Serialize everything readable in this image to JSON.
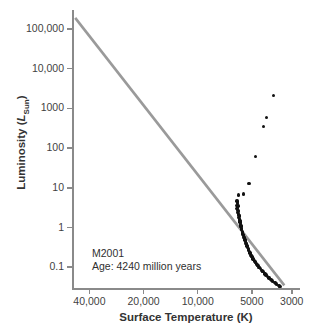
{
  "chart_data": {
    "type": "scatter",
    "title": "",
    "xlabel": "Surface Temperature (K)",
    "ylabel": "Luminosity (L_Sun)",
    "ylabel_prefix": "Luminosity (",
    "ylabel_symbol": "L",
    "ylabel_subscript": "Sun",
    "ylabel_suffix": ")",
    "xticks": [
      "40,000",
      "20,000",
      "10,000",
      "5000",
      "3000"
    ],
    "xtick_values": [
      40000,
      20000,
      10000,
      5000,
      3000
    ],
    "yticks": [
      "100,000",
      "10,000",
      "1000",
      "100",
      "10",
      "1",
      "0.1"
    ],
    "ytick_values": [
      100000,
      10000,
      1000,
      100,
      10,
      1,
      0.1
    ],
    "xlim": [
      50000,
      2700
    ],
    "ylim": [
      0.03,
      300000
    ],
    "x_axis_scale": "log-reversed",
    "y_axis_scale": "log",
    "grid": false,
    "legend": false,
    "annotations": [
      {
        "name": "cluster-name",
        "text": "M2001"
      },
      {
        "name": "cluster-age",
        "text": "Age: 4240 million years"
      }
    ],
    "colors": {
      "point": "#111111",
      "zams_line": "#9a9a9a",
      "axis": "#8a8a8a",
      "text": "#3a3a3a",
      "background": "#ffffff"
    },
    "series": [
      {
        "name": "Zero-Age Main Sequence",
        "type": "line",
        "color": "#9a9a9a",
        "points": [
          {
            "temp": 48000,
            "lum": 190000
          },
          {
            "temp": 3300,
            "lum": 0.035
          }
        ]
      },
      {
        "name": "Main Sequence Stars",
        "type": "scatter",
        "color": "#111111",
        "points": [
          {
            "temp": 6050,
            "lum": 4.6
          },
          {
            "temp": 6020,
            "lum": 4.0
          },
          {
            "temp": 6080,
            "lum": 3.6
          },
          {
            "temp": 5990,
            "lum": 3.3
          },
          {
            "temp": 6040,
            "lum": 3.0
          },
          {
            "temp": 5960,
            "lum": 2.7
          },
          {
            "temp": 6000,
            "lum": 2.4
          },
          {
            "temp": 5940,
            "lum": 2.2
          },
          {
            "temp": 5900,
            "lum": 2.0
          },
          {
            "temp": 5930,
            "lum": 1.8
          },
          {
            "temp": 5870,
            "lum": 1.65
          },
          {
            "temp": 5850,
            "lum": 1.5
          },
          {
            "temp": 5820,
            "lum": 1.38
          },
          {
            "temp": 5800,
            "lum": 1.25
          },
          {
            "temp": 5770,
            "lum": 1.15
          },
          {
            "temp": 5740,
            "lum": 1.05
          },
          {
            "temp": 5710,
            "lum": 0.96
          },
          {
            "temp": 5690,
            "lum": 0.88
          },
          {
            "temp": 5650,
            "lum": 0.8
          },
          {
            "temp": 5620,
            "lum": 0.73
          },
          {
            "temp": 5600,
            "lum": 0.67
          },
          {
            "temp": 5560,
            "lum": 0.62
          },
          {
            "temp": 5530,
            "lum": 0.57
          },
          {
            "temp": 5500,
            "lum": 0.52
          },
          {
            "temp": 5460,
            "lum": 0.48
          },
          {
            "temp": 5430,
            "lum": 0.44
          },
          {
            "temp": 5400,
            "lum": 0.4
          },
          {
            "temp": 5360,
            "lum": 0.37
          },
          {
            "temp": 5320,
            "lum": 0.34
          },
          {
            "temp": 5280,
            "lum": 0.31
          },
          {
            "temp": 5240,
            "lum": 0.285
          },
          {
            "temp": 5200,
            "lum": 0.26
          },
          {
            "temp": 5150,
            "lum": 0.24
          },
          {
            "temp": 5100,
            "lum": 0.22
          },
          {
            "temp": 5050,
            "lum": 0.2
          },
          {
            "temp": 5000,
            "lum": 0.185
          },
          {
            "temp": 4950,
            "lum": 0.17
          },
          {
            "temp": 4880,
            "lum": 0.155
          },
          {
            "temp": 4820,
            "lum": 0.142
          },
          {
            "temp": 4760,
            "lum": 0.13
          },
          {
            "temp": 4700,
            "lum": 0.12
          },
          {
            "temp": 4630,
            "lum": 0.11
          },
          {
            "temp": 4560,
            "lum": 0.1
          },
          {
            "temp": 4490,
            "lum": 0.092
          },
          {
            "temp": 4420,
            "lum": 0.084
          },
          {
            "temp": 4340,
            "lum": 0.077
          },
          {
            "temp": 4260,
            "lum": 0.07
          },
          {
            "temp": 4180,
            "lum": 0.064
          },
          {
            "temp": 4100,
            "lum": 0.058
          },
          {
            "temp": 4010,
            "lum": 0.053
          },
          {
            "temp": 3920,
            "lum": 0.049
          },
          {
            "temp": 3830,
            "lum": 0.045
          },
          {
            "temp": 3740,
            "lum": 0.041
          },
          {
            "temp": 3650,
            "lum": 0.038
          },
          {
            "temp": 3560,
            "lum": 0.035
          },
          {
            "temp": 3480,
            "lum": 0.033
          },
          {
            "temp": 6030,
            "lum": 4.3
          },
          {
            "temp": 5970,
            "lum": 3.45
          },
          {
            "temp": 5910,
            "lum": 2.55
          },
          {
            "temp": 5860,
            "lum": 1.95
          },
          {
            "temp": 5810,
            "lum": 1.45
          },
          {
            "temp": 5760,
            "lum": 1.1
          },
          {
            "temp": 5700,
            "lum": 0.92
          },
          {
            "temp": 5640,
            "lum": 0.76
          },
          {
            "temp": 5580,
            "lum": 0.64
          },
          {
            "temp": 5510,
            "lum": 0.55
          },
          {
            "temp": 5440,
            "lum": 0.46
          },
          {
            "temp": 5370,
            "lum": 0.39
          },
          {
            "temp": 5300,
            "lum": 0.33
          },
          {
            "temp": 5220,
            "lum": 0.275
          },
          {
            "temp": 5130,
            "lum": 0.23
          },
          {
            "temp": 5030,
            "lum": 0.19
          },
          {
            "temp": 4920,
            "lum": 0.162
          },
          {
            "temp": 4790,
            "lum": 0.136
          },
          {
            "temp": 4660,
            "lum": 0.115
          },
          {
            "temp": 4520,
            "lum": 0.097
          },
          {
            "temp": 4380,
            "lum": 0.081
          },
          {
            "temp": 4220,
            "lum": 0.067
          },
          {
            "temp": 4050,
            "lum": 0.056
          },
          {
            "temp": 3880,
            "lum": 0.047
          },
          {
            "temp": 3700,
            "lum": 0.04
          },
          {
            "temp": 3520,
            "lum": 0.034
          }
        ]
      },
      {
        "name": "Turnoff and Subgiant Stars",
        "type": "scatter",
        "color": "#111111",
        "points": [
          {
            "temp": 5930,
            "lum": 6.6
          },
          {
            "temp": 5560,
            "lum": 7.0
          },
          {
            "temp": 5180,
            "lum": 13.0
          }
        ]
      },
      {
        "name": "Red Giant Branch Stars",
        "type": "scatter",
        "color": "#111111",
        "points": [
          {
            "temp": 4780,
            "lum": 62
          },
          {
            "temp": 4300,
            "lum": 350
          },
          {
            "temp": 4130,
            "lum": 580
          },
          {
            "temp": 3780,
            "lum": 2100
          }
        ]
      }
    ]
  }
}
